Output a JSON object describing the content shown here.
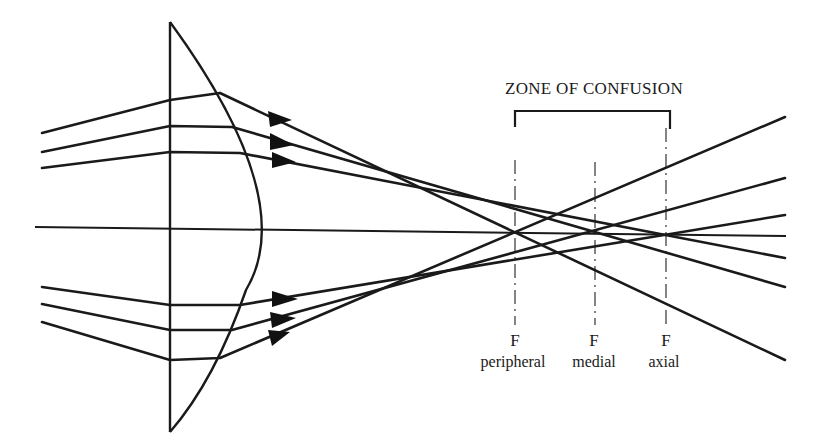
{
  "title": "ZONE OF CONFUSION",
  "foci": [
    {
      "letter": "F",
      "name": "peripheral",
      "x": 515
    },
    {
      "letter": "F",
      "name": "medial",
      "x": 595
    },
    {
      "letter": "F",
      "name": "axial",
      "x": 668
    }
  ],
  "colors": {
    "ink": "#1a1a1a",
    "background": "#ffffff"
  },
  "components": {
    "lens": "plano-convex lens",
    "optical_axis": "principal axis",
    "rays": "6 incident rays (3 above, 3 below axis) showing spherical aberration"
  }
}
